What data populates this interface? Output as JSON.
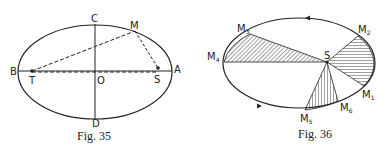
{
  "figures": [
    {
      "caption": "Fig. 35",
      "labels": {
        "A": "A",
        "B": "B",
        "C": "C",
        "D": "D",
        "O": "O",
        "S": "S",
        "T": "T",
        "M": "M"
      }
    },
    {
      "caption": "Fig. 36",
      "labels": {
        "S": "S",
        "M": "M",
        "sub1": "1",
        "sub2": "2",
        "sub3": "3",
        "sub4": "4",
        "sub5": "5",
        "sub6": "6"
      }
    }
  ],
  "colors": {
    "ink": "#222222",
    "hatch": "#555555",
    "background": "#ffffff"
  }
}
